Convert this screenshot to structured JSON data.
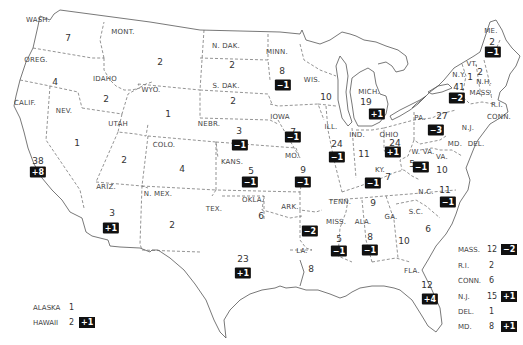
{
  "map": {
    "title": "",
    "states": [
      {
        "abbr": "WASH.",
        "seats": "7",
        "change": null,
        "lx": 38,
        "ly": 20,
        "nx": 68,
        "ny": 38
      },
      {
        "abbr": "OREG.",
        "seats": "4",
        "change": null,
        "lx": 36,
        "ly": 60,
        "nx": 55,
        "ny": 82
      },
      {
        "abbr": "CALIF.",
        "seats": "38",
        "change": "+8",
        "lx": 25,
        "ly": 103,
        "nx": 38,
        "ny": 161,
        "bx": 38,
        "by": 172
      },
      {
        "abbr": "IDAHO",
        "seats": "2",
        "change": null,
        "lx": 105,
        "ly": 79,
        "nx": 106,
        "ny": 99
      },
      {
        "abbr": "MONT.",
        "seats": "2",
        "change": null,
        "lx": 123,
        "ly": 32,
        "nx": 160,
        "ny": 62
      },
      {
        "abbr": "WYO.",
        "seats": "1",
        "change": null,
        "lx": 151,
        "ly": 90,
        "nx": 168,
        "ny": 114
      },
      {
        "abbr": "NEV.",
        "seats": "1",
        "change": null,
        "lx": 64,
        "ly": 111,
        "nx": 77,
        "ny": 143
      },
      {
        "abbr": "UTAH",
        "seats": "2",
        "change": null,
        "lx": 118,
        "ly": 124,
        "nx": 124,
        "ny": 160
      },
      {
        "abbr": "COLO.",
        "seats": "4",
        "change": null,
        "lx": 164,
        "ly": 145,
        "nx": 182,
        "ny": 169
      },
      {
        "abbr": "ARIZ.",
        "seats": "3",
        "change": "+1",
        "lx": 106,
        "ly": 187,
        "nx": 112,
        "ny": 213,
        "bx": 111,
        "by": 228
      },
      {
        "abbr": "N. MEX.",
        "seats": "2",
        "change": null,
        "lx": 158,
        "ly": 194,
        "nx": 172,
        "ny": 225
      },
      {
        "abbr": "N. DAK.",
        "seats": "2",
        "change": null,
        "lx": 226,
        "ly": 46,
        "nx": 232,
        "ny": 65
      },
      {
        "abbr": "S. DAK.",
        "seats": "2",
        "change": null,
        "lx": 226,
        "ly": 86,
        "nx": 233,
        "ny": 101
      },
      {
        "abbr": "NEBR.",
        "seats": "3",
        "change": "-1",
        "lx": 209,
        "ly": 124,
        "nx": 239,
        "ny": 131,
        "bx": 240,
        "by": 145
      },
      {
        "abbr": "KANS.",
        "seats": "5",
        "change": "-1",
        "lx": 232,
        "ly": 162,
        "nx": 251,
        "ny": 171,
        "bx": 250,
        "by": 182
      },
      {
        "abbr": "OKLA.",
        "seats": "6",
        "change": null,
        "lx": 253,
        "ly": 200,
        "nx": 261,
        "ny": 216
      },
      {
        "abbr": "TEX.",
        "seats": "23",
        "change": "+1",
        "lx": 214,
        "ly": 209,
        "nx": 243,
        "ny": 259,
        "bx": 243,
        "by": 273
      },
      {
        "abbr": "MINN.",
        "seats": "8",
        "change": "-1",
        "lx": 277,
        "ly": 52,
        "nx": 282,
        "ny": 71,
        "bx": 283,
        "by": 85
      },
      {
        "abbr": "IOWA",
        "seats": "7",
        "change": "-1",
        "lx": 280,
        "ly": 117,
        "nx": 293,
        "ny": 132,
        "bx": 293,
        "by": 137
      },
      {
        "abbr": "MO.",
        "seats": "9",
        "change": "-1",
        "lx": 292,
        "ly": 156,
        "nx": 303,
        "ny": 170,
        "bx": 303,
        "by": 182
      },
      {
        "abbr": "ARK.",
        "seats": "4",
        "change": "-2",
        "lx": 290,
        "ly": 207,
        "nx": 309,
        "ny": 230,
        "bx": 310,
        "by": 231
      },
      {
        "abbr": "LA.",
        "seats": "8",
        "change": null,
        "lx": 302,
        "ly": 251,
        "nx": 311,
        "ny": 269
      },
      {
        "abbr": "WIS.",
        "seats": "10",
        "change": null,
        "lx": 312,
        "ly": 80,
        "nx": 326,
        "ny": 97
      },
      {
        "abbr": "ILL.",
        "seats": "24",
        "change": "-1",
        "lx": 331,
        "ly": 127,
        "nx": 337,
        "ny": 144,
        "bx": 337,
        "by": 157
      },
      {
        "abbr": "MICH.",
        "seats": "19",
        "change": "+1",
        "lx": 369,
        "ly": 92,
        "nx": 366,
        "ny": 102,
        "bx": 377,
        "by": 114
      },
      {
        "abbr": "IND.",
        "seats": "11",
        "change": null,
        "lx": 357,
        "ly": 135,
        "nx": 364,
        "ny": 154
      },
      {
        "abbr": "OHIO",
        "seats": "24",
        "change": "+1",
        "lx": 389,
        "ly": 135,
        "nx": 395,
        "ny": 143,
        "bx": 393,
        "by": 152
      },
      {
        "abbr": "KY.",
        "seats": "7",
        "change": "-1",
        "lx": 380,
        "ly": 170,
        "nx": 388,
        "ny": 177,
        "bx": 373,
        "by": 183
      },
      {
        "abbr": "TENN.",
        "seats": "9",
        "change": null,
        "lx": 340,
        "ly": 202,
        "nx": 373,
        "ny": 203
      },
      {
        "abbr": "MISS.",
        "seats": "5",
        "change": "-1",
        "lx": 336,
        "ly": 222,
        "nx": 339,
        "ny": 239,
        "bx": 339,
        "by": 251
      },
      {
        "abbr": "ALA.",
        "seats": "8",
        "change": "-1",
        "lx": 363,
        "ly": 222,
        "nx": 370,
        "ny": 237,
        "bx": 370,
        "by": 250
      },
      {
        "abbr": "GA.",
        "seats": "10",
        "change": null,
        "lx": 391,
        "ly": 217,
        "nx": 404,
        "ny": 241
      },
      {
        "abbr": "FLA.",
        "seats": "12",
        "change": "+4",
        "lx": 412,
        "ly": 271,
        "nx": 427,
        "ny": 285,
        "bx": 430,
        "by": 299
      },
      {
        "abbr": "S.C.",
        "seats": "6",
        "change": null,
        "lx": 416,
        "ly": 212,
        "nx": 428,
        "ny": 229
      },
      {
        "abbr": "N.C.",
        "seats": "11",
        "change": "-1",
        "lx": 426,
        "ly": 192,
        "nx": 445,
        "ny": 190,
        "bx": 448,
        "by": 202
      },
      {
        "abbr": "VA.",
        "seats": "10",
        "change": null,
        "lx": 442,
        "ly": 157,
        "nx": 442,
        "ny": 170
      },
      {
        "abbr": "W. VA.",
        "seats": "5",
        "change": "-1",
        "lx": 423,
        "ly": 152,
        "nx": 412,
        "ny": 164,
        "bx": 421,
        "by": 167
      },
      {
        "abbr": "PA.",
        "seats": "27",
        "change": "-3",
        "lx": 420,
        "ly": 118,
        "nx": 442,
        "ny": 116,
        "bx": 436,
        "by": 130
      },
      {
        "abbr": "N.Y.",
        "seats": "41",
        "change": "-2",
        "lx": 459,
        "ly": 75,
        "nx": 459,
        "ny": 87,
        "bx": 457,
        "by": 98
      },
      {
        "abbr": "VT.",
        "seats": "1",
        "change": null,
        "lx": 472,
        "ly": 64,
        "nx": 470,
        "ny": 77
      },
      {
        "abbr": "N.H.",
        "seats": "2",
        "change": null,
        "lx": 484,
        "ly": 82,
        "nx": 480,
        "ny": 72
      },
      {
        "abbr": "ME.",
        "seats": "2",
        "change": "-1",
        "lx": 491,
        "ly": 31,
        "nx": 492,
        "ny": 42,
        "bx": 493,
        "by": 52
      },
      {
        "abbr": "MASS.",
        "seats": "",
        "change": null,
        "lx": 481,
        "ly": 93,
        "nx": 0,
        "ny": 0
      },
      {
        "abbr": "R.I.",
        "seats": "",
        "change": null,
        "lx": 497,
        "ly": 105,
        "nx": 0,
        "ny": 0
      },
      {
        "abbr": "CONN.",
        "seats": "",
        "change": null,
        "lx": 499,
        "ly": 117,
        "nx": 0,
        "ny": 0
      },
      {
        "abbr": "N.J.",
        "seats": "",
        "change": null,
        "lx": 468,
        "ly": 128,
        "nx": 0,
        "ny": 0
      },
      {
        "abbr": "MD.",
        "seats": "",
        "change": null,
        "lx": 455,
        "ly": 144,
        "nx": 0,
        "ny": 0
      },
      {
        "abbr": "DEL.",
        "seats": "",
        "change": null,
        "lx": 476,
        "ly": 144,
        "nx": 0,
        "ny": 0
      }
    ]
  },
  "legend_east": [
    {
      "name": "MASS.",
      "seats": "12",
      "change": "-2"
    },
    {
      "name": "R.I.",
      "seats": "2",
      "change": null
    },
    {
      "name": "CONN.",
      "seats": "6",
      "change": null
    },
    {
      "name": "N.J.",
      "seats": "15",
      "change": "+1"
    },
    {
      "name": "DEL.",
      "seats": "1",
      "change": null
    },
    {
      "name": "MD.",
      "seats": "8",
      "change": "+1"
    }
  ],
  "legend_west": [
    {
      "name": "ALASKA",
      "seats": "1",
      "change": null
    },
    {
      "name": "HAWAII",
      "seats": "2",
      "change": "+1"
    }
  ],
  "colors": {
    "badge_bg": "#111111",
    "badge_fg": "#ffffff",
    "line": "#555555",
    "text": "#333333"
  }
}
